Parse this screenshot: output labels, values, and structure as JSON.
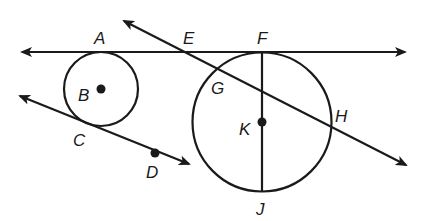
{
  "figure": {
    "type": "geometry",
    "colors": {
      "ink": "#1a1a1a",
      "background": "#ffffff"
    },
    "points": [
      {
        "name": "A",
        "x": 101,
        "y": 52,
        "label_x": 94,
        "label_y": 44
      },
      {
        "name": "B",
        "x": 101,
        "y": 89,
        "label_x": 78,
        "label_y": 101,
        "dot": true
      },
      {
        "name": "C",
        "x": 86,
        "y": 124,
        "label_x": 73,
        "label_y": 146
      },
      {
        "name": "D",
        "x": 155,
        "y": 153,
        "label_x": 146,
        "label_y": 178,
        "dot": true
      },
      {
        "name": "E",
        "x": 183,
        "y": 52,
        "label_x": 183,
        "label_y": 44
      },
      {
        "name": "F",
        "x": 262,
        "y": 52,
        "label_x": 257,
        "label_y": 44
      },
      {
        "name": "G",
        "x": 217,
        "y": 70,
        "label_x": 211,
        "label_y": 94
      },
      {
        "name": "H",
        "x": 329,
        "y": 127,
        "label_x": 335,
        "label_y": 122
      },
      {
        "name": "K",
        "x": 262,
        "y": 122,
        "label_x": 239,
        "label_y": 135,
        "dot": true
      },
      {
        "name": "J",
        "x": 262,
        "y": 191,
        "label_x": 256,
        "label_y": 215
      }
    ],
    "circles": [
      {
        "name": "circle-B",
        "cx": 101,
        "cy": 89,
        "r": 37
      },
      {
        "name": "circle-K",
        "cx": 262,
        "cy": 122,
        "r": 69.5
      }
    ],
    "lines": [
      {
        "name": "tangent-line-AF",
        "x1": 22,
        "y1": 52,
        "x2": 405,
        "y2": 52,
        "arrows": "both"
      },
      {
        "name": "secant-line-EH",
        "x1": 124,
        "y1": 21,
        "x2": 406,
        "y2": 165,
        "arrows": "both"
      },
      {
        "name": "tangent-line-CD",
        "x1": 20,
        "y1": 96,
        "x2": 189,
        "y2": 164,
        "arrows": "both"
      }
    ],
    "segments": [
      {
        "name": "diameter-FJ",
        "x1": 262,
        "y1": 52,
        "x2": 262,
        "y2": 191
      }
    ]
  }
}
